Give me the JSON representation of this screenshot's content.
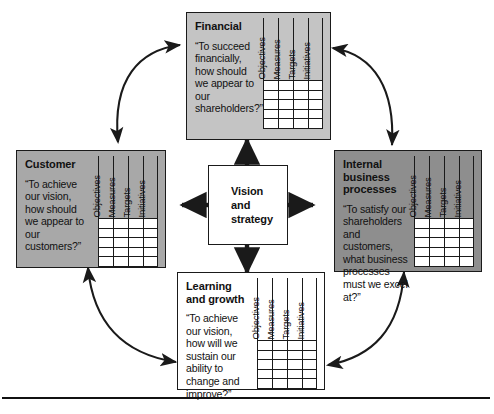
{
  "diagram": {
    "center": {
      "label": "Vision\nand\nstrategy",
      "line1": "Vision",
      "line2": "and",
      "line3": "strategy",
      "background": "#ffffff",
      "border": "#1a1a1a"
    },
    "table_headers": [
      "Objectives",
      "Measures",
      "Targets",
      "Initiatives"
    ],
    "table_empty_rows": 5,
    "quadrants": [
      {
        "id": "financial",
        "title": "Financial",
        "quote": "“To succeed financially, how should we appear to our shareholders?”",
        "background": "#c4c4c4",
        "position": "top"
      },
      {
        "id": "customer",
        "title": "Customer",
        "quote": "“To achieve our vision, how should we appear to our customers?”",
        "background": "#a8a8a8",
        "position": "left"
      },
      {
        "id": "internal-business-processes",
        "title": "Internal business processes",
        "quote": "“To satisfy our shareholders and customers, what business processes must we excel at?”",
        "background": "#8e8e8e",
        "position": "right"
      },
      {
        "id": "learning-and-growth",
        "title": "Learning and growth",
        "quote": "“To achieve our vision, how will we sustain our ability to change and improve?”",
        "background": "#ffffff",
        "position": "bottom"
      }
    ],
    "connectors": {
      "radial_arrows": [
        "center-to-financial",
        "center-to-customer",
        "center-to-internal-business-processes",
        "center-to-learning-and-growth"
      ],
      "cycle_arrows": [
        "customer-financial",
        "financial-internal-business-processes",
        "customer-learning-and-growth",
        "internal-business-processes-learning-and-growth"
      ],
      "arrow_color": "#1a1a1a",
      "double_headed": true
    },
    "footer_rule": true
  }
}
